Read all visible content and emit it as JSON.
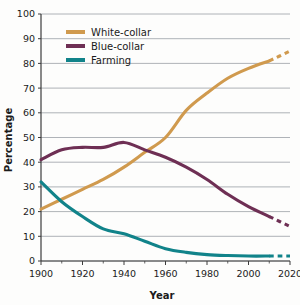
{
  "chart_data": {
    "type": "line",
    "title": "",
    "xlabel": "Year",
    "ylabel": "Percentage",
    "xlim": [
      1900,
      2020
    ],
    "ylim": [
      0,
      100
    ],
    "grid": true,
    "legend_position": "top-left-inside",
    "x_ticks": [
      1900,
      1920,
      1940,
      1960,
      1980,
      2000,
      2020
    ],
    "x_minor_ticks": [
      1910,
      1930,
      1950,
      1970,
      1990,
      2010
    ],
    "y_ticks": [
      0,
      10,
      20,
      30,
      40,
      50,
      60,
      70,
      80,
      90,
      100
    ],
    "series": [
      {
        "name": "White-collar",
        "color": "#d09a4e",
        "x": [
          1900,
          1910,
          1920,
          1930,
          1940,
          1950,
          1960,
          1970,
          1980,
          1990,
          2000,
          2010
        ],
        "values": [
          21,
          25,
          29,
          33,
          38,
          44,
          50,
          61,
          68,
          74,
          78,
          81
        ],
        "projected_x": [
          2010,
          2020
        ],
        "projected_values": [
          81,
          85
        ]
      },
      {
        "name": "Blue-collar",
        "color": "#6e2f54",
        "x": [
          1900,
          1910,
          1920,
          1930,
          1940,
          1950,
          1960,
          1970,
          1980,
          1990,
          2000,
          2010
        ],
        "values": [
          41,
          45,
          46,
          46,
          48,
          45,
          42,
          38,
          33,
          27,
          22,
          18
        ],
        "projected_x": [
          2010,
          2020
        ],
        "projected_values": [
          18,
          14
        ]
      },
      {
        "name": "Farming",
        "color": "#11838a",
        "x": [
          1900,
          1910,
          1920,
          1930,
          1940,
          1950,
          1960,
          1970,
          1980,
          1990,
          2000,
          2010
        ],
        "values": [
          32,
          24,
          18,
          13,
          11,
          8,
          5,
          3.5,
          2.6,
          2.2,
          2,
          2
        ],
        "projected_x": [
          2010,
          2020
        ],
        "projected_values": [
          2,
          2
        ]
      }
    ]
  },
  "legend": {
    "items": [
      {
        "label": "White-collar",
        "color": "#d09a4e"
      },
      {
        "label": "Blue-collar",
        "color": "#6e2f54"
      },
      {
        "label": "Farming",
        "color": "#11838a"
      }
    ]
  },
  "axes": {
    "y_title": "Percentage",
    "x_title": "Year",
    "y_tick_labels": [
      "100",
      "90",
      "80",
      "70",
      "60",
      "50",
      "40",
      "30",
      "20",
      "10",
      "0"
    ],
    "x_tick_labels": [
      "1900",
      "1920",
      "1940",
      "1960",
      "1980",
      "2000",
      "2020"
    ]
  },
  "colors": {
    "grid": "#9aa0a6",
    "axis": "#3c3c3c",
    "background": "#fdfdfc",
    "text": "#1b1b1b"
  }
}
